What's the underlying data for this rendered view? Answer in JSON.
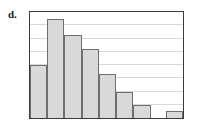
{
  "figure": {
    "part_label": "d.",
    "frame_color": "#3c3c3c",
    "grid_color": "#d8d8d8",
    "bar_fill": "#d9d9d9",
    "bar_edge": "#6f6f6f",
    "background": "#ffffff"
  },
  "chart_data": {
    "type": "bar",
    "title": "",
    "subtitle": "",
    "xlabel": "",
    "ylabel": "",
    "categories": [
      "1",
      "2",
      "3",
      "4",
      "5",
      "6",
      "7",
      "8",
      "9"
    ],
    "values": [
      4.0,
      7.5,
      6.3,
      5.2,
      3.3,
      2.0,
      1.0,
      0.0,
      0.5
    ],
    "ylim": [
      0,
      8
    ],
    "xlim": [
      0,
      9
    ],
    "grid": true,
    "gridlines_y": [
      1,
      2,
      3,
      4,
      5,
      6,
      7
    ],
    "tick_labels_x": [],
    "tick_labels_y": [],
    "legend": [],
    "legend_position": "none",
    "annotations": []
  }
}
